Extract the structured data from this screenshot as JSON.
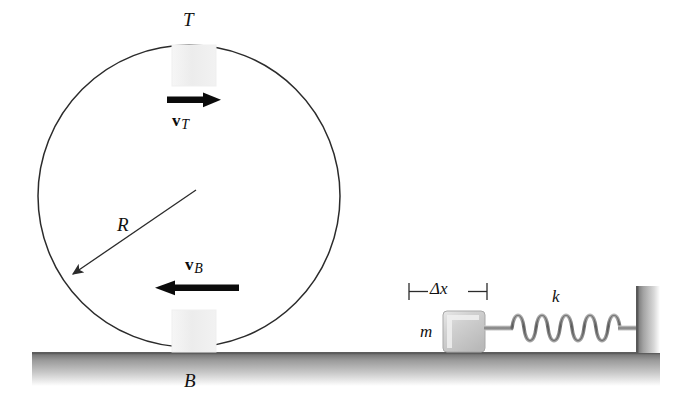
{
  "figure": {
    "background_color": "#ffffff",
    "line_color": "#2b2b2b",
    "arrow_color": "#0b0b0b",
    "ground_color": "#8c8c8c",
    "block_fill": "#eeeeee",
    "mass_fill": "#cfcfcf",
    "spring_color": "#8f8f8f"
  },
  "wheel": {
    "center_x": 189,
    "center_y": 196,
    "radius": 151,
    "top_label": "T",
    "bottom_label": "B",
    "radius_label": "R"
  },
  "velocities": [
    {
      "name": "top-velocity",
      "symbol": "v",
      "subscript": "T",
      "direction": "right",
      "x1": 167,
      "x2": 219,
      "y": 100
    },
    {
      "name": "bottom-velocity",
      "symbol": "v",
      "subscript": "B",
      "direction": "left",
      "x1": 239,
      "x2": 155,
      "y": 288
    }
  ],
  "spring_system": {
    "mass_label": "m",
    "spring_constant_label": "k",
    "compression_label": "Δx",
    "coil_count": 10
  },
  "ground": {
    "left": 32,
    "right": 660,
    "top": 352,
    "thickness": 33
  },
  "wall": {
    "left": 636,
    "top": 286,
    "width": 24
  }
}
